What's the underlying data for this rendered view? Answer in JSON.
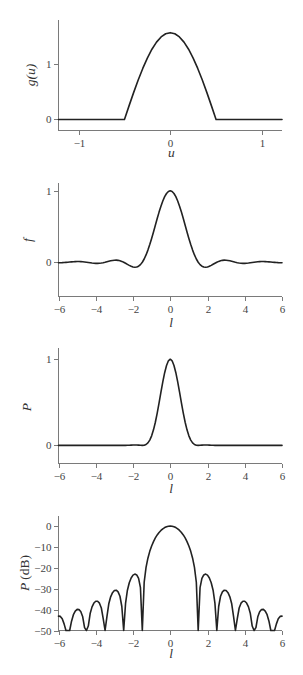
{
  "style": {
    "curve_color": "#222222",
    "axis_color": "#7a7a7a",
    "background": "#ffffff"
  },
  "chart_data": [
    {
      "id": "aperture-g",
      "type": "line",
      "title": "",
      "xlabel": "u",
      "ylabel": "g(u)",
      "xlim": [
        -1.22,
        1.22
      ],
      "ylim": [
        -0.2,
        1.8
      ],
      "xticks": [
        -1,
        0,
        1
      ],
      "xtick_labels": [
        "−1",
        "0",
        "1"
      ],
      "yticks": [
        0,
        1
      ],
      "ytick_labels": [
        "0",
        "1"
      ],
      "grid": false,
      "legend": null,
      "series": [
        {
          "name": "g(u)",
          "x": [
            -1.22,
            -0.5,
            -0.45,
            -0.4,
            -0.35,
            -0.3,
            -0.25,
            -0.2,
            -0.15,
            -0.1,
            -0.05,
            0,
            0.05,
            0.1,
            0.15,
            0.2,
            0.25,
            0.3,
            0.35,
            0.4,
            0.45,
            0.5,
            1.22
          ],
          "y": [
            0,
            0,
            0.2457,
            0.4854,
            0.7131,
            0.9233,
            1.1107,
            1.2708,
            1.3996,
            1.4939,
            1.5515,
            1.5708,
            1.5515,
            1.4939,
            1.3996,
            1.2708,
            1.1107,
            0.9233,
            0.7131,
            0.4854,
            0.2457,
            0,
            0
          ]
        }
      ]
    },
    {
      "id": "field-f",
      "type": "line",
      "title": "",
      "xlabel": "l",
      "ylabel": "f",
      "xlim": [
        -6,
        6
      ],
      "ylim": [
        -0.48,
        1.11
      ],
      "xticks": [
        -6,
        -4,
        -2,
        0,
        2,
        4,
        6
      ],
      "xtick_labels": [
        "−6",
        "−4",
        "−2",
        "0",
        "2",
        "4",
        "6"
      ],
      "yticks": [
        0,
        1
      ],
      "ytick_labels": [
        "0",
        "1"
      ],
      "grid": false,
      "legend": null,
      "series": [
        {
          "name": "f(l)",
          "x": [
            -6,
            -5.9,
            -5.8,
            -5.7,
            -5.6,
            -5.5,
            -5.4,
            -5.3,
            -5.2,
            -5.1,
            -5,
            -4.9,
            -4.8,
            -4.7,
            -4.6,
            -4.5,
            -4.4,
            -4.3,
            -4.2,
            -4.1,
            -4,
            -3.9,
            -3.8,
            -3.7,
            -3.6,
            -3.5,
            -3.4,
            -3.3,
            -3.2,
            -3.1,
            -3,
            -2.9,
            -2.8,
            -2.7,
            -2.6,
            -2.5,
            -2.4,
            -2.3,
            -2.2,
            -2.1,
            -2,
            -1.9,
            -1.8,
            -1.7,
            -1.6,
            -1.5,
            -1.4,
            -1.3,
            -1.2,
            -1.1,
            -1,
            -0.9,
            -0.8,
            -0.7,
            -0.6,
            -0.5,
            -0.4,
            -0.3,
            -0.2,
            -0.1,
            0,
            0.1,
            0.2,
            0.3,
            0.4,
            0.5,
            0.6,
            0.7,
            0.8,
            0.9,
            1,
            1.1,
            1.2,
            1.3,
            1.4,
            1.5,
            1.6,
            1.7,
            1.8,
            1.9,
            2,
            2.1,
            2.2,
            2.3,
            2.4,
            2.5,
            2.6,
            2.7,
            2.8,
            2.9,
            3,
            3.1,
            3.2,
            3.3,
            3.4,
            3.5,
            3.6,
            3.7,
            3.8,
            3.9,
            4,
            4.1,
            4.2,
            4.3,
            4.4,
            4.5,
            4.6,
            4.7,
            4.8,
            4.9,
            5,
            5.1,
            5.2,
            5.3,
            5.4,
            5.5,
            5.6,
            5.7,
            5.8,
            5.9,
            6
          ],
          "y": [
            -0.007,
            -0.0069,
            -0.0061,
            -0.0046,
            -0.0025,
            0,
            0.0027,
            0.0053,
            0.0075,
            0.0092,
            0.0101,
            0.01,
            0.0089,
            0.0067,
            0.0037,
            0,
            -0.004,
            -0.0081,
            -0.0116,
            -0.0144,
            -0.0159,
            -0.0159,
            -0.0143,
            -0.0109,
            -0.0061,
            0,
            0.0068,
            0.0138,
            0.0202,
            0.0254,
            0.0286,
            0.0291,
            0.0266,
            0.0209,
            0.0119,
            0,
            -0.014,
            -0.0292,
            -0.0441,
            -0.0572,
            -0.0667,
            -0.0708,
            -0.0676,
            -0.0557,
            -0.0334,
            0,
            0.0452,
            0.102,
            0.17,
            0.2477,
            0.3333,
            0.4246,
            0.5186,
            0.6123,
            0.7023,
            0.7854,
            0.8584,
            0.9184,
            0.9631,
            0.9907,
            1,
            0.9907,
            0.9631,
            0.9184,
            0.8584,
            0.7854,
            0.7023,
            0.6123,
            0.5186,
            0.4246,
            0.3333,
            0.2477,
            0.17,
            0.102,
            0.0452,
            0,
            -0.0334,
            -0.0557,
            -0.0676,
            -0.0708,
            -0.0667,
            -0.0572,
            -0.0441,
            -0.0292,
            -0.014,
            0,
            0.0119,
            0.0209,
            0.0266,
            0.0291,
            0.0286,
            0.0254,
            0.0202,
            0.0138,
            0.0068,
            0,
            -0.0061,
            -0.0109,
            -0.0143,
            -0.0159,
            -0.0159,
            -0.0144,
            -0.0116,
            -0.0081,
            -0.004,
            0,
            0.0037,
            0.0067,
            0.0089,
            0.01,
            0.0101,
            0.0092,
            0.0075,
            0.0053,
            0.0027,
            0,
            -0.0025,
            -0.0046,
            -0.0061,
            -0.0069,
            -0.007
          ]
        }
      ]
    },
    {
      "id": "power-P",
      "type": "line",
      "title": "",
      "xlabel": "l",
      "ylabel": "P",
      "xlim": [
        -6,
        6
      ],
      "ylim": [
        -0.21,
        1.13
      ],
      "xticks": [
        -6,
        -4,
        -2,
        0,
        2,
        4,
        6
      ],
      "xtick_labels": [
        "−6",
        "−4",
        "−2",
        "0",
        "2",
        "4",
        "6"
      ],
      "yticks": [
        0,
        1
      ],
      "ytick_labels": [
        "0",
        "1"
      ],
      "grid": false,
      "legend": null,
      "series": [
        {
          "name": "P(l)",
          "x": [
            -6,
            -5.9,
            -5.8,
            -5.7,
            -5.6,
            -5.5,
            -5.4,
            -5.3,
            -5.2,
            -5.1,
            -5,
            -4.9,
            -4.8,
            -4.7,
            -4.6,
            -4.5,
            -4.4,
            -4.3,
            -4.2,
            -4.1,
            -4,
            -3.9,
            -3.8,
            -3.7,
            -3.6,
            -3.5,
            -3.4,
            -3.3,
            -3.2,
            -3.1,
            -3,
            -2.9,
            -2.8,
            -2.7,
            -2.6,
            -2.5,
            -2.4,
            -2.3,
            -2.2,
            -2.1,
            -2,
            -1.9,
            -1.8,
            -1.7,
            -1.6,
            -1.5,
            -1.4,
            -1.3,
            -1.2,
            -1.1,
            -1,
            -0.9,
            -0.8,
            -0.7,
            -0.6,
            -0.5,
            -0.4,
            -0.3,
            -0.2,
            -0.1,
            0,
            0.1,
            0.2,
            0.3,
            0.4,
            0.5,
            0.6,
            0.7,
            0.8,
            0.9,
            1,
            1.1,
            1.2,
            1.3,
            1.4,
            1.5,
            1.6,
            1.7,
            1.8,
            1.9,
            2,
            2.1,
            2.2,
            2.3,
            2.4,
            2.5,
            2.6,
            2.7,
            2.8,
            2.9,
            3,
            3.1,
            3.2,
            3.3,
            3.4,
            3.5,
            3.6,
            3.7,
            3.8,
            3.9,
            4,
            4.1,
            4.2,
            4.3,
            4.4,
            4.5,
            4.6,
            4.7,
            4.8,
            4.9,
            5,
            5.1,
            5.2,
            5.3,
            5.4,
            5.5,
            5.6,
            5.7,
            5.8,
            5.9,
            6
          ],
          "y": [
            0,
            0,
            0,
            0,
            0,
            0,
            0,
            0,
            0.0001,
            0.0001,
            0.0001,
            0.0001,
            0.0001,
            0,
            0,
            0,
            0,
            0.0001,
            0.0001,
            0.0002,
            0.0003,
            0.0003,
            0.0002,
            0.0001,
            0,
            0,
            0,
            0.0002,
            0.0004,
            0.0006,
            0.0008,
            0.0008,
            0.0007,
            0.0004,
            0.0001,
            0,
            0.0002,
            0.0009,
            0.0019,
            0.0033,
            0.0044,
            0.005,
            0.0046,
            0.0031,
            0.0011,
            0,
            0.002,
            0.0104,
            0.0289,
            0.0614,
            0.1111,
            0.1803,
            0.2689,
            0.3749,
            0.4932,
            0.6169,
            0.7369,
            0.8435,
            0.9276,
            0.9815,
            1,
            0.9815,
            0.9276,
            0.8435,
            0.7369,
            0.6169,
            0.4932,
            0.3749,
            0.2689,
            0.1803,
            0.1111,
            0.0614,
            0.0289,
            0.0104,
            0.002,
            0,
            0.0011,
            0.0031,
            0.0046,
            0.005,
            0.0044,
            0.0033,
            0.0019,
            0.0009,
            0.0002,
            0,
            0.0001,
            0.0004,
            0.0007,
            0.0008,
            0.0008,
            0.0006,
            0.0004,
            0.0002,
            0,
            0,
            0,
            0.0001,
            0.0002,
            0.0003,
            0.0003,
            0.0002,
            0.0001,
            0.0001,
            0,
            0,
            0,
            0,
            0.0001,
            0.0001,
            0.0001,
            0.0001,
            0.0001,
            0,
            0,
            0,
            0,
            0,
            0,
            0,
            0
          ]
        }
      ]
    },
    {
      "id": "power-dB",
      "type": "line",
      "title": "",
      "xlabel": "l",
      "ylabel": "P",
      "ylabel_unit": "(dB)",
      "xlim": [
        -6,
        6
      ],
      "ylim": [
        -50,
        4.8
      ],
      "xticks": [
        -6,
        -4,
        -2,
        0,
        2,
        4,
        6
      ],
      "xtick_labels": [
        "−6",
        "−4",
        "−2",
        "0",
        "2",
        "4",
        "6"
      ],
      "yticks": [
        0,
        -10,
        -20,
        -30,
        -40,
        -50
      ],
      "ytick_labels": [
        "0",
        "−10",
        "−20",
        "−30",
        "−40",
        "−50"
      ],
      "grid": false,
      "legend": null,
      "clipped_floor_db": -50,
      "series": [
        {
          "name": "P(l) in dB",
          "x": [
            -6,
            -5.9,
            -5.8,
            -5.7,
            -5.6,
            -5.5,
            -5.4,
            -5.3,
            -5.2,
            -5.1,
            -5,
            -4.9,
            -4.8,
            -4.7,
            -4.6,
            -4.5,
            -4.4,
            -4.3,
            -4.2,
            -4.1,
            -4,
            -3.9,
            -3.8,
            -3.7,
            -3.6,
            -3.5,
            -3.4,
            -3.3,
            -3.2,
            -3.1,
            -3,
            -2.9,
            -2.8,
            -2.7,
            -2.6,
            -2.5,
            -2.4,
            -2.3,
            -2.2,
            -2.1,
            -2,
            -1.9,
            -1.8,
            -1.7,
            -1.6,
            -1.5,
            -1.4,
            -1.3,
            -1.2,
            -1.1,
            -1,
            -0.9,
            -0.8,
            -0.7,
            -0.6,
            -0.5,
            -0.4,
            -0.3,
            -0.2,
            -0.1,
            0,
            0.1,
            0.2,
            0.3,
            0.4,
            0.5,
            0.6,
            0.7,
            0.8,
            0.9,
            1,
            1.1,
            1.2,
            1.3,
            1.4,
            1.5,
            1.6,
            1.7,
            1.8,
            1.9,
            2,
            2.1,
            2.2,
            2.3,
            2.4,
            2.5,
            2.6,
            2.7,
            2.8,
            2.9,
            3,
            3.1,
            3.2,
            3.3,
            3.4,
            3.5,
            3.6,
            3.7,
            3.8,
            3.9,
            4,
            4.1,
            4.2,
            4.3,
            4.4,
            4.5,
            4.6,
            4.7,
            4.8,
            4.9,
            5,
            5.1,
            5.2,
            5.3,
            5.4,
            5.5,
            5.6,
            5.7,
            5.8,
            5.9,
            6
          ],
          "y": [
            -43.11,
            -43.25,
            -44.35,
            -46.82,
            -50,
            -50,
            -50,
            -45.55,
            -42.44,
            -40.7,
            -39.91,
            -39.99,
            -41.04,
            -43.44,
            -48.65,
            -50,
            -47.87,
            -41.88,
            -38.69,
            -36.86,
            -35.99,
            -35.98,
            -36.92,
            -39.23,
            -44.32,
            -50,
            -43.31,
            -37.2,
            -33.87,
            -31.9,
            -30.88,
            -30.71,
            -31.49,
            -33.61,
            -38.51,
            -50,
            -37.06,
            -30.71,
            -27.12,
            -24.86,
            -23.52,
            -23.0,
            -23.4,
            -25.09,
            -29.51,
            -50,
            -26.9,
            -19.82,
            -15.39,
            -12.12,
            -9.54,
            -7.44,
            -5.7,
            -4.26,
            -3.07,
            -2.1,
            -1.33,
            -0.74,
            -0.33,
            -0.08,
            0,
            -0.08,
            -0.33,
            -0.74,
            -1.33,
            -2.1,
            -3.07,
            -4.26,
            -5.7,
            -7.44,
            -9.54,
            -12.12,
            -15.39,
            -19.82,
            -26.9,
            -50,
            -29.51,
            -25.09,
            -23.4,
            -23.0,
            -23.52,
            -24.86,
            -27.12,
            -30.71,
            -37.06,
            -50,
            -38.51,
            -33.61,
            -31.49,
            -30.71,
            -30.88,
            -31.9,
            -33.87,
            -37.2,
            -43.31,
            -50,
            -44.32,
            -39.23,
            -36.92,
            -35.98,
            -35.99,
            -36.86,
            -38.69,
            -41.88,
            -47.87,
            -50,
            -48.65,
            -43.44,
            -41.04,
            -39.99,
            -39.91,
            -40.7,
            -42.44,
            -45.55,
            -50,
            -50,
            -50,
            -46.82,
            -44.35,
            -43.25,
            -43.11
          ]
        }
      ]
    }
  ]
}
